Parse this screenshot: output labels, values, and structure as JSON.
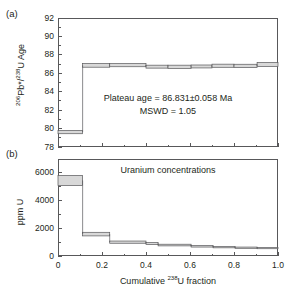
{
  "figure": {
    "panel_a_label": "(a)",
    "panel_b_label": "(b)"
  },
  "chart_data": [
    {
      "type": "bar",
      "panel": "(a)",
      "title": "",
      "xlabel": "Cumulative 238U fraction",
      "ylabel": "206Pb*/238U Age",
      "ylabel_html": "<sup>206</sup>Pb*/<sup>238</sup>U Age",
      "xlim": [
        0,
        1.0
      ],
      "ylim": [
        78,
        92
      ],
      "yticks": [
        78,
        80,
        82,
        84,
        86,
        88,
        90,
        92
      ],
      "ytick_labels": [
        "78",
        "80",
        "82",
        "84",
        "86",
        "88",
        "90",
        "92"
      ],
      "xticks": [
        0,
        0.2,
        0.4,
        0.6,
        0.8,
        1.0
      ],
      "xtick_labels": [
        "0",
        "0.2",
        "0.4",
        "0.6",
        "0.8",
        "1.0"
      ],
      "x_minor_ticks": [
        0.1,
        0.3,
        0.5,
        0.7,
        0.9
      ],
      "y_minor_ticks": [
        79,
        81,
        83,
        85,
        87,
        89,
        91
      ],
      "grid": false,
      "legend": "none",
      "annotations": [
        "Plateau age = 86.831±0.058 Ma",
        "MSWD = 1.05"
      ],
      "annotation_plateau": "Plateau age = 86.831±0.058 Ma",
      "annotation_mswd": "MSWD = 1.05",
      "series_name": "Age spectrum steps",
      "steps": [
        {
          "x0": 0.0,
          "x1": 0.112,
          "y": 79.62,
          "err": 0.18
        },
        {
          "x0": 0.112,
          "x1": 0.235,
          "y": 86.86,
          "err": 0.2
        },
        {
          "x0": 0.235,
          "x1": 0.4,
          "y": 86.88,
          "err": 0.17
        },
        {
          "x0": 0.4,
          "x1": 0.5,
          "y": 86.72,
          "err": 0.16
        },
        {
          "x0": 0.5,
          "x1": 0.605,
          "y": 86.7,
          "err": 0.18
        },
        {
          "x0": 0.605,
          "x1": 0.7,
          "y": 86.74,
          "err": 0.16
        },
        {
          "x0": 0.7,
          "x1": 0.8,
          "y": 86.82,
          "err": 0.17
        },
        {
          "x0": 0.8,
          "x1": 0.905,
          "y": 86.8,
          "err": 0.18
        },
        {
          "x0": 0.905,
          "x1": 1.0,
          "y": 86.95,
          "err": 0.22
        }
      ]
    },
    {
      "type": "bar",
      "panel": "(b)",
      "title": "Uranium concentrations",
      "xlabel": "Cumulative 238U fraction",
      "ylabel": "ppm U",
      "xlim": [
        0,
        1.0
      ],
      "ylim": [
        0,
        7000
      ],
      "yticks": [
        0,
        2000,
        4000,
        6000
      ],
      "ytick_labels": [
        "0",
        "2000",
        "4000",
        "6000"
      ],
      "y_minor_ticks": [
        1000,
        3000,
        5000,
        7000
      ],
      "xticks": [
        0,
        0.2,
        0.4,
        0.6,
        0.8,
        1.0
      ],
      "xtick_labels": [
        "0",
        "0.2",
        "0.4",
        "0.6",
        "0.8",
        "1.0"
      ],
      "x_minor_ticks": [
        0.1,
        0.3,
        0.5,
        0.7,
        0.9
      ],
      "grid": false,
      "legend": "none",
      "series_name": "Uranium concentration steps",
      "steps": [
        {
          "x0": 0.0,
          "x1": 0.112,
          "y": 5450,
          "err": 370
        },
        {
          "x0": 0.112,
          "x1": 0.235,
          "y": 1580,
          "err": 130
        },
        {
          "x0": 0.235,
          "x1": 0.4,
          "y": 1000,
          "err": 80
        },
        {
          "x0": 0.4,
          "x1": 0.455,
          "y": 900,
          "err": 70
        },
        {
          "x0": 0.455,
          "x1": 0.605,
          "y": 790,
          "err": 60
        },
        {
          "x0": 0.605,
          "x1": 0.705,
          "y": 700,
          "err": 55
        },
        {
          "x0": 0.705,
          "x1": 0.805,
          "y": 640,
          "err": 50
        },
        {
          "x0": 0.805,
          "x1": 0.905,
          "y": 600,
          "err": 45
        },
        {
          "x0": 0.905,
          "x1": 1.0,
          "y": 570,
          "err": 45
        }
      ]
    }
  ]
}
